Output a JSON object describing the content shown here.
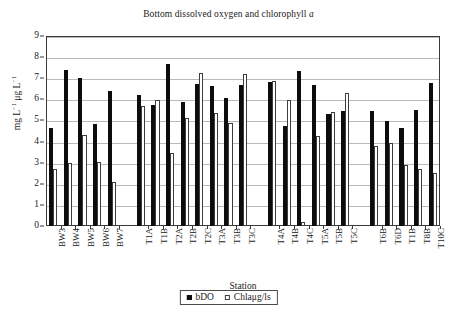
{
  "chart_data": {
    "type": "bar",
    "title": "Bottom dissolved oxygen and chlorophyll a",
    "title_plain": "Bottom dissolved oxygen and chlorophyll ",
    "title_italic": "a",
    "xlabel": "Station",
    "ylabel": "mg L−1 μg L−1",
    "ylim": [
      0,
      9
    ],
    "yticks": [
      0,
      1,
      2,
      3,
      4,
      5,
      6,
      7,
      8,
      9
    ],
    "grid": true,
    "legend_position": "bottom-center",
    "categories": [
      "BW3",
      "BW4",
      "BW5",
      "BW6",
      "BW7",
      "T1A",
      "T1B",
      "T2A",
      "T2B",
      "T2C",
      "T3A",
      "T3B",
      "T3C",
      "T4A",
      "T4B",
      "T4C",
      "T5A",
      "T5B",
      "T5C",
      "T6B",
      "T6D",
      "T1B",
      "T8B",
      "T10C"
    ],
    "group_breaks_after": [
      "BW7",
      "T3C",
      "T5C"
    ],
    "series": [
      {
        "name": "bDO",
        "style": "filled-black",
        "color": "#0d0d0d",
        "values": [
          4.65,
          7.4,
          7.03,
          4.81,
          6.4,
          6.19,
          5.74,
          7.68,
          5.86,
          6.74,
          6.63,
          6.05,
          6.69,
          6.81,
          4.72,
          7.36,
          6.7,
          5.31,
          5.43,
          5.43,
          4.97,
          4.62,
          5.5,
          6.77
        ]
      },
      {
        "name": "Chlaμg/ls",
        "style": "open-white",
        "color": "#ffffff",
        "values": [
          2.68,
          3.0,
          4.3,
          3.05,
          2.1,
          5.68,
          5.97,
          3.48,
          5.13,
          7.26,
          5.36,
          4.86,
          7.22,
          6.85,
          5.96,
          0.2,
          4.26,
          5.39,
          6.28,
          3.78,
          3.93,
          2.88,
          2.68,
          2.53
        ]
      }
    ]
  },
  "legend": {
    "items": [
      {
        "label": "bDO",
        "swatch": "filled-square-icon"
      },
      {
        "label": "Chlaμg/ls",
        "swatch": "open-square-icon"
      }
    ]
  }
}
